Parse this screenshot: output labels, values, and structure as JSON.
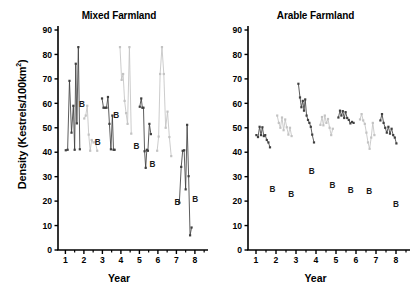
{
  "axis_label_y": "Density (Kestrels/100km",
  "axis_label_y_sup": "2",
  "axis_label_y_tail": ")",
  "colors": {
    "dark_series": "#404040",
    "light_series": "#c3c3c3",
    "axis": "#000000",
    "text": "#000000",
    "background": "#ffffff"
  },
  "panels": {
    "left": {
      "title": "Mixed Farmland",
      "xlabel": "Year"
    },
    "right": {
      "title": "Arable Farmland",
      "xlabel": "Year"
    }
  },
  "chart_data": [
    {
      "type": "line",
      "title": "Mixed Farmland",
      "xlabel": "Year",
      "ylabel": "Density (Kestrels/100km2)",
      "xlim": [
        0.6,
        8.6
      ],
      "ylim": [
        0,
        90
      ],
      "ytick_labels": [
        "0",
        "10",
        "20",
        "30",
        "40",
        "50",
        "60",
        "70",
        "80",
        "90"
      ],
      "yticks": [
        0,
        10,
        20,
        30,
        40,
        50,
        60,
        70,
        80,
        90
      ],
      "xtick_labels": [
        "1",
        "2",
        "3",
        "4",
        "5",
        "6",
        "7",
        "8"
      ],
      "xticks": [
        1,
        2,
        3,
        4,
        5,
        6,
        7,
        8
      ],
      "minor_xticks": [
        1.5,
        2.5,
        3.5,
        4.5,
        5.5,
        6.5,
        7.5,
        8.5
      ],
      "grid": false,
      "legend": "none",
      "series": [
        {
          "name": "dark-segment-1",
          "color": "#404040",
          "points": [
            [
              1.02,
              40.8
            ],
            [
              1.12,
              41.0
            ],
            [
              1.22,
              69.2
            ],
            [
              1.33,
              48.0
            ],
            [
              1.43,
              59.0
            ],
            [
              1.5,
              41.0
            ],
            [
              1.56,
              76.2
            ],
            [
              1.62,
              51.8
            ],
            [
              1.7,
              83.0
            ],
            [
              1.78,
              41.2
            ]
          ]
        },
        {
          "name": "light-segment-1",
          "color": "#c3c3c3",
          "points": [
            [
              2.02,
              53.8
            ],
            [
              2.1,
              55.0
            ],
            [
              2.18,
              59.0
            ],
            [
              2.26,
              47.2
            ],
            [
              2.34,
              40.6
            ],
            [
              2.42,
              45.0
            ],
            [
              2.52,
              44.0
            ],
            [
              2.62,
              44.2
            ],
            [
              2.72,
              40.6
            ]
          ]
        },
        {
          "name": "dark-segment-2",
          "color": "#404040",
          "points": [
            [
              2.98,
              62.0
            ],
            [
              3.06,
              58.2
            ],
            [
              3.14,
              58.2
            ],
            [
              3.22,
              58.2
            ],
            [
              3.3,
              62.6
            ],
            [
              3.38,
              51.6
            ],
            [
              3.46,
              41.2
            ],
            [
              3.54,
              55.0
            ],
            [
              3.6,
              41.0
            ],
            [
              3.66,
              41.0
            ]
          ]
        },
        {
          "name": "light-segment-2",
          "color": "#c3c3c3",
          "points": [
            [
              3.95,
              83.0
            ],
            [
              4.04,
              69.6
            ],
            [
              4.12,
              72.0
            ],
            [
              4.2,
              61.0
            ],
            [
              4.28,
              56.0
            ],
            [
              4.36,
              51.6
            ],
            [
              4.46,
              83.0
            ],
            [
              4.56,
              47.6
            ]
          ]
        },
        {
          "name": "dark-segment-3",
          "color": "#404040",
          "points": [
            [
              5.02,
              58.6
            ],
            [
              5.1,
              62.0
            ],
            [
              5.16,
              58.2
            ],
            [
              5.22,
              58.2
            ],
            [
              5.28,
              40.4
            ],
            [
              5.34,
              33.6
            ],
            [
              5.4,
              41.0
            ],
            [
              5.46,
              40.6
            ],
            [
              5.54,
              51.6
            ],
            [
              5.62,
              47.4
            ]
          ]
        },
        {
          "name": "light-segment-3",
          "color": "#c3c3c3",
          "points": [
            [
              5.96,
              40.6
            ],
            [
              6.04,
              46.4
            ],
            [
              6.12,
              72.0
            ],
            [
              6.22,
              83.0
            ],
            [
              6.32,
              72.0
            ],
            [
              6.42,
              50.0
            ],
            [
              6.52,
              56.6
            ],
            [
              6.62,
              46.2
            ],
            [
              6.72,
              38.4
            ]
          ]
        },
        {
          "name": "dark-segment-4",
          "color": "#404040",
          "points": [
            [
              7.16,
              19.4
            ],
            [
              7.26,
              34.0
            ],
            [
              7.34,
              40.6
            ],
            [
              7.42,
              40.8
            ],
            [
              7.5,
              24.8
            ],
            [
              7.58,
              51.2
            ],
            [
              7.66,
              30.2
            ],
            [
              7.74,
              6.0
            ],
            [
              7.82,
              9.2
            ]
          ]
        }
      ],
      "annotations": [
        {
          "text": "B",
          "x": 1.9,
          "y": 58.6
        },
        {
          "text": "B",
          "x": 2.74,
          "y": 43.0
        },
        {
          "text": "B",
          "x": 3.74,
          "y": 54.2
        },
        {
          "text": "B",
          "x": 4.84,
          "y": 41.2
        },
        {
          "text": "B",
          "x": 5.7,
          "y": 34.0
        },
        {
          "text": "B",
          "x": 7.06,
          "y": 18.6
        },
        {
          "text": "B",
          "x": 8.02,
          "y": 19.6
        }
      ]
    },
    {
      "type": "line",
      "title": "Arable Farmland",
      "xlabel": "Year",
      "ylabel": "Density (Kestrels/100km2)",
      "xlim": [
        0.6,
        8.6
      ],
      "ylim": [
        0,
        90
      ],
      "ytick_labels": [
        "0",
        "10",
        "20",
        "30",
        "40",
        "50",
        "60",
        "70",
        "80",
        "90"
      ],
      "yticks": [
        0,
        10,
        20,
        30,
        40,
        50,
        60,
        70,
        80,
        90
      ],
      "xtick_labels": [
        "1",
        "2",
        "3",
        "4",
        "5",
        "6",
        "7",
        "8"
      ],
      "xticks": [
        1,
        2,
        3,
        4,
        5,
        6,
        7,
        8
      ],
      "minor_xticks": [
        1.5,
        2.5,
        3.5,
        4.5,
        5.5,
        6.5,
        7.5,
        8.5
      ],
      "grid": false,
      "legend": "none",
      "series": [
        {
          "name": "dark-segment-1",
          "color": "#404040",
          "points": [
            [
              1.02,
              47.0
            ],
            [
              1.1,
              46.2
            ],
            [
              1.18,
              50.4
            ],
            [
              1.25,
              47.0
            ],
            [
              1.32,
              50.2
            ],
            [
              1.39,
              46.6
            ],
            [
              1.46,
              47.0
            ],
            [
              1.54,
              45.0
            ],
            [
              1.62,
              44.0
            ],
            [
              1.7,
              42.0
            ]
          ]
        },
        {
          "name": "light-segment-1",
          "color": "#c3c3c3",
          "points": [
            [
              2.06,
              55.0
            ],
            [
              2.14,
              52.0
            ],
            [
              2.22,
              50.0
            ],
            [
              2.3,
              54.2
            ],
            [
              2.38,
              49.0
            ],
            [
              2.46,
              53.4
            ],
            [
              2.54,
              50.2
            ],
            [
              2.62,
              47.2
            ],
            [
              2.7,
              50.0
            ],
            [
              2.78,
              46.6
            ]
          ]
        },
        {
          "name": "dark-segment-2",
          "color": "#404040",
          "points": [
            [
              3.12,
              68.0
            ],
            [
              3.2,
              62.4
            ],
            [
              3.27,
              58.4
            ],
            [
              3.34,
              61.0
            ],
            [
              3.4,
              57.0
            ],
            [
              3.46,
              61.6
            ],
            [
              3.53,
              55.0
            ],
            [
              3.6,
              53.2
            ],
            [
              3.67,
              52.0
            ],
            [
              3.74,
              50.4
            ],
            [
              3.81,
              47.2
            ],
            [
              3.9,
              44.0
            ]
          ]
        },
        {
          "name": "light-segment-2",
          "color": "#c3c3c3",
          "points": [
            [
              4.22,
              51.2
            ],
            [
              4.3,
              54.4
            ],
            [
              4.37,
              51.0
            ],
            [
              4.44,
              55.0
            ],
            [
              4.52,
              52.0
            ],
            [
              4.6,
              53.6
            ],
            [
              4.68,
              50.0
            ],
            [
              4.76,
              47.0
            ],
            [
              4.84,
              49.6
            ]
          ]
        },
        {
          "name": "dark-segment-3",
          "color": "#404040",
          "points": [
            [
              5.12,
              54.2
            ],
            [
              5.2,
              57.0
            ],
            [
              5.27,
              55.0
            ],
            [
              5.34,
              56.8
            ],
            [
              5.41,
              54.0
            ],
            [
              5.48,
              56.4
            ],
            [
              5.56,
              54.0
            ],
            [
              5.64,
              53.2
            ],
            [
              5.72,
              51.8
            ],
            [
              5.8,
              52.4
            ],
            [
              5.88,
              52.0
            ]
          ]
        },
        {
          "name": "light-segment-3",
          "color": "#c3c3c3",
          "points": [
            [
              6.2,
              53.4
            ],
            [
              6.28,
              55.6
            ],
            [
              6.36,
              53.0
            ],
            [
              6.44,
              51.6
            ],
            [
              6.52,
              48.0
            ],
            [
              6.6,
              44.0
            ],
            [
              6.68,
              41.4
            ],
            [
              6.76,
              46.0
            ],
            [
              6.84,
              52.0
            ],
            [
              6.92,
              47.0
            ]
          ]
        },
        {
          "name": "dark-segment-4",
          "color": "#404040",
          "points": [
            [
              7.22,
              53.0
            ],
            [
              7.3,
              55.6
            ],
            [
              7.38,
              52.0
            ],
            [
              7.46,
              50.0
            ],
            [
              7.54,
              48.0
            ],
            [
              7.62,
              50.4
            ],
            [
              7.7,
              47.6
            ],
            [
              7.78,
              49.6
            ],
            [
              7.86,
              47.0
            ],
            [
              7.94,
              46.0
            ],
            [
              8.02,
              43.6
            ]
          ]
        }
      ],
      "annotations": [
        {
          "text": "B",
          "x": 1.82,
          "y": 23.8
        },
        {
          "text": "B",
          "x": 2.76,
          "y": 21.8
        },
        {
          "text": "B",
          "x": 3.78,
          "y": 31.0
        },
        {
          "text": "B",
          "x": 4.82,
          "y": 25.2
        },
        {
          "text": "B",
          "x": 5.74,
          "y": 23.2
        },
        {
          "text": "B",
          "x": 6.66,
          "y": 23.0
        },
        {
          "text": "B",
          "x": 8.0,
          "y": 17.4
        }
      ]
    }
  ]
}
